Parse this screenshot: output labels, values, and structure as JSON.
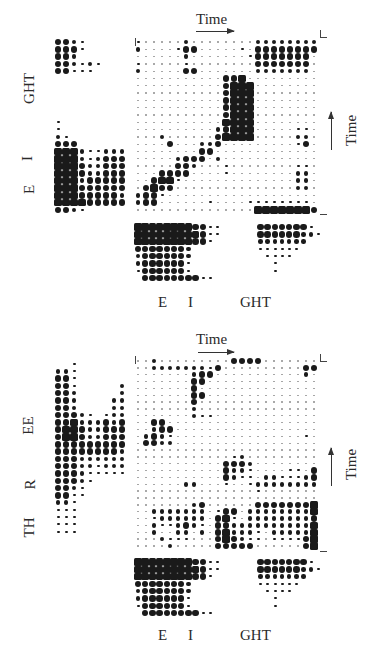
{
  "chart_data": [
    {
      "type": "heatmap",
      "title": "",
      "top_axis": {
        "label": "Time",
        "arrow": "right"
      },
      "right_axis": {
        "label": "Time",
        "arrow": "up"
      },
      "left_labels": [
        "GHT",
        "I",
        "E"
      ],
      "bottom_labels": [
        "E",
        "I",
        "GHT"
      ],
      "encoding": "dot size 0-4 per cell; rows listed top to bottom",
      "main": [
        "10000020000000022222222",
        "20000133000001033333333",
        "00000020000000133333330",
        "10000010000000033333330",
        "20000033000000022222220",
        "00000000000334000000000",
        "00000000000344400000000",
        "00000000000344400000000",
        "00000000000344400000000",
        "00000000000344400000000",
        "00000000000344400000000",
        "00000000000444400000000",
        "00000000002344400000110",
        "00020000003444400000220",
        "00003000223000000000130",
        "00000000330000000000000",
        "00000233302000000000000",
        "00000332000100000000110",
        "00033330000100000000220",
        "00344100000000000000220",
        "03433000000000000000220",
        "23310000000000000000000",
        "23300000010000111111110",
        "00000000000000044444443"
      ],
      "left": [
        "332100000",
        "333100000",
        "332000000",
        "332121000",
        "331110000",
        "000000000",
        "000000000",
        "000000000",
        "000000000",
        "000000000",
        "000000000",
        "100000000",
        "100000000",
        "210000000",
        "333000000",
        "444211222",
        "444212333",
        "444322333",
        "444322333",
        "444233333",
        "444333333",
        "444333332",
        "444433333",
        "332100000"
      ],
      "bottom": [
        "44444444331100000333333310",
        "44444444431100000333333221",
        "44444444331000000222222200",
        "33333332000000000111111000",
        "23333332000000000011110000",
        "23333331000000000001000000",
        "13333331000000000001000000",
        "03333333311000000000000000"
      ]
    },
    {
      "type": "heatmap",
      "title": "",
      "top_axis": {
        "label": "Time",
        "arrow": "right"
      },
      "right_axis": {
        "label": "Time",
        "arrow": "up"
      },
      "left_labels": [
        "EE",
        "R",
        "TH"
      ],
      "bottom_labels": [
        "E",
        "I",
        "GHT"
      ],
      "encoding": "dot size 0-4 per cell; rows listed top to bottom",
      "main": [
        "00200000000033330000000",
        "00222222213000000000033",
        "00000002330000000000020",
        "00000003300000000000000",
        "00000003000000000000000",
        "00000003300000000000000",
        "00000003000000000000000",
        "00000002000000000000000",
        "00000002110000000000000",
        "00330000000000000000000",
        "00233000000000000000000",
        "02321000000000000000010",
        "03322000000000000000000",
        "00000000000000000000000",
        "00000000000012000000000",
        "00000000000333200000000",
        "00000000000322100001103",
        "00000000000321102211123",
        "00000022000100122222222",
        "00000000000000010000000",
        "00000000000000000000000",
        "00000002300000033333334",
        "00222222201330222222224",
        "00122222203410222222223",
        "00211232103322222222224",
        "00200220203422210222224",
        "00021110003432110111134",
        "00002000003333300000034"
      ],
      "left": [
        "001000000",
        "221000000",
        "331000000",
        "331000002",
        "332000002",
        "332000022",
        "332000022",
        "333210122",
        "334222323",
        "344322333",
        "344322333",
        "333333333",
        "333333332",
        "333222222",
        "333221222",
        "333211111",
        "333210000",
        "332100000",
        "331100000",
        "221000000",
        "111000000",
        "111000000",
        "111000000",
        "111000000"
      ],
      "bottom": [
        "44444444331100000333333310",
        "44444444431100000333333221",
        "44444444331000000222222200",
        "33333332000000000111111000",
        "23333332000000000011110000",
        "23333331000000000001000000",
        "13333331000000000001000000",
        "03333333311000000000000000"
      ]
    }
  ],
  "figures": [
    {
      "top_time_label": "Time",
      "right_time_label": "Time",
      "left_labels": {
        "a": "GHT",
        "b": "I",
        "c": "E"
      },
      "bottom_labels": {
        "a": "E",
        "b": "I",
        "c": "GHT"
      }
    },
    {
      "top_time_label": "Time",
      "right_time_label": "Time",
      "left_labels": {
        "a": "EE",
        "b": "R",
        "c": "TH"
      },
      "bottom_labels": {
        "a": "E",
        "b": "I",
        "c": "GHT"
      }
    }
  ]
}
